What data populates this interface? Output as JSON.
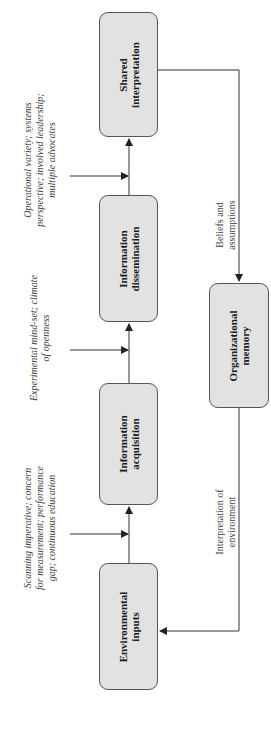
{
  "diagram": {
    "orientation": "rotated-90-ccw",
    "colors": {
      "box_fill": "#e2e2e2",
      "box_border": "#555555",
      "line": "#333333",
      "annotation_text": "#444444"
    },
    "nodes": [
      {
        "id": "environmental-inputs",
        "label": "Environmental\ninputs"
      },
      {
        "id": "information-acquisition",
        "label": "Information\nacquisition"
      },
      {
        "id": "information-dissemination",
        "label": "Information\ndissemination"
      },
      {
        "id": "shared-interpretation",
        "label": "Shared\ninterpretation"
      },
      {
        "id": "organizational-memory",
        "label": "Organizational\nmemory"
      }
    ],
    "annotations": [
      {
        "id": "factors-acquisition",
        "text": "Scanning imperative; concern\nfor measurement; performance\ngap; continuous education"
      },
      {
        "id": "factors-dissemination",
        "text": "Experimental mind-set; climate\nof openness"
      },
      {
        "id": "factors-interpretation",
        "text": "Operational variety; systems\nperspective; involved leadership;\nmultiple advocates"
      }
    ],
    "edge_labels": [
      {
        "id": "beliefs",
        "text": "Beliefs and\nassumptions"
      },
      {
        "id": "interpretation-env",
        "text": "Interpretation of\nenvironment"
      }
    ],
    "edges": [
      {
        "from": "environmental-inputs",
        "to": "information-acquisition"
      },
      {
        "from": "information-acquisition",
        "to": "information-dissemination"
      },
      {
        "from": "information-dissemination",
        "to": "shared-interpretation"
      },
      {
        "from": "shared-interpretation",
        "to": "organizational-memory",
        "label": "Beliefs and\nassumptions"
      },
      {
        "from": "organizational-memory",
        "to": "environmental-inputs",
        "label": "Interpretation of\nenvironment"
      }
    ]
  }
}
